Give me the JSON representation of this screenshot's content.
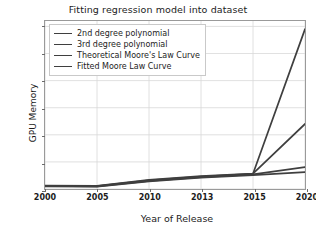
{
  "chart_data": {
    "type": "line",
    "title": "Fitting regression model into dataset",
    "xlabel": "Year of Release",
    "ylabel": "GPU Memory",
    "x": [
      2000,
      2005,
      2010,
      2013,
      2015,
      2020
    ],
    "xtick_labels": [
      "2000",
      "2005",
      "2010",
      "2013",
      "2015",
      "2020"
    ],
    "ytick_labels": [
      "0",
      "10",
      "20",
      "30",
      "40",
      "50",
      "60"
    ],
    "yticks": [
      0,
      10,
      20,
      30,
      40,
      50,
      60
    ],
    "ylim": [
      0,
      62
    ],
    "grid": true,
    "legend_position": "upper left",
    "series": [
      {
        "name": "2nd degree polynomial",
        "color": "#3f3f3f",
        "values": [
          1.2,
          1.1,
          3.2,
          4.6,
          5.6,
          59.0
        ]
      },
      {
        "name": "3rd degree polynomial",
        "color": "#3f3f3f",
        "values": [
          1.3,
          1.2,
          3.4,
          4.8,
          5.7,
          24.0
        ]
      },
      {
        "name": "Theoretical Moore's Law Curve",
        "color": "#3f3f3f",
        "values": [
          1.1,
          1.0,
          3.0,
          4.4,
          5.4,
          8.1
        ]
      },
      {
        "name": "Fitted Moore Law Curve",
        "color": "#3f3f3f",
        "values": [
          1.0,
          0.9,
          2.8,
          4.2,
          5.1,
          6.2
        ]
      }
    ]
  }
}
